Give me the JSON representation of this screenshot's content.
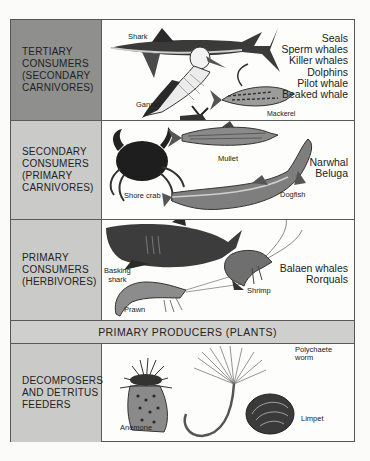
{
  "figure": {
    "rows": [
      {
        "id": "tertiary",
        "label": "TERTIARY\nCONSUMERS\n(SECONDARY\nCARNIVORES)",
        "illustrated": [
          "Shark",
          "Gannet",
          "Mackerel"
        ],
        "listed": [
          "Seals",
          "Sperm  whales",
          "Killer  whales",
          "Dolphins",
          "Pilot  whale",
          "Beaked  whale"
        ]
      },
      {
        "id": "secondary",
        "label": "SECONDARY\nCONSUMERS\n(PRIMARY\nCARNIVORES)",
        "illustrated": [
          "Shore crab",
          "Mullet",
          "Dogfish"
        ],
        "listed": [
          "Narwhal",
          "Beluga"
        ]
      },
      {
        "id": "primary",
        "label": "PRIMARY\nCONSUMERS\n(HERBIVORES)",
        "illustrated": [
          "Basking\nshark",
          "Prawn",
          "Shrimp"
        ],
        "listed": [
          "Balaen  whales",
          "Rorquals"
        ]
      },
      {
        "id": "producers",
        "banner": "PRIMARY PRODUCERS (PLANTS)"
      },
      {
        "id": "decomposers",
        "label": "DECOMPOSERS\nAND DETRITUS\nFEEDERS",
        "illustrated": [
          "Anemone",
          "Polychaete\nworm",
          "Limpet"
        ],
        "listed": []
      }
    ]
  },
  "colors": {
    "tertiary_label_bg": "#8f8f8d",
    "label_bg": "#cacac8",
    "banner_bg": "#cfcfcd",
    "border": "#555555"
  }
}
